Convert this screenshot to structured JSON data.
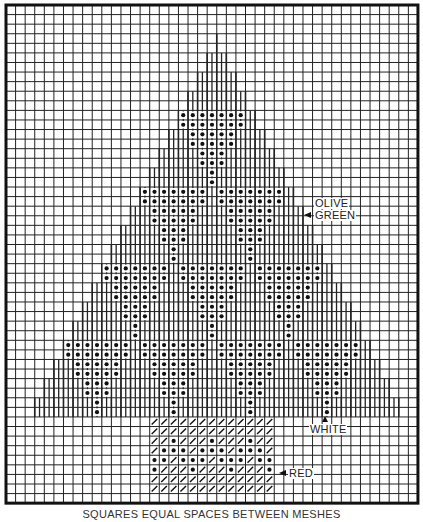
{
  "grid": {
    "origin_x": 6,
    "origin_y": 5,
    "cell": 9.58,
    "cols": 43,
    "rows": 52,
    "line_color": "#222222",
    "border_width": 3
  },
  "tree": {
    "apex_col": 22,
    "apex_row": 3,
    "lines_bottom_row": 43,
    "rows_per_step": 2,
    "half_width_start": 0,
    "max_half_width": 21
  },
  "dot_tiers": [
    {
      "row": 11,
      "starts": [
        18
      ]
    },
    {
      "row": 19,
      "starts": [
        14,
        22
      ]
    },
    {
      "row": 27,
      "starts": [
        10,
        18,
        26
      ]
    },
    {
      "row": 35,
      "starts": [
        6,
        14,
        22,
        30
      ]
    }
  ],
  "triangle_widths": [
    7,
    7,
    5,
    5,
    3,
    3,
    1,
    1
  ],
  "trunk": {
    "col": 15,
    "row": 43,
    "cols": 13,
    "rows": 8,
    "dot_rows": {
      "2": [
        2,
        6,
        10
      ],
      "3": [
        1,
        2,
        3,
        5,
        6,
        7,
        9,
        10,
        11
      ],
      "4": [
        0,
        1,
        3,
        4,
        5,
        7,
        8,
        9,
        11,
        12
      ],
      "5": [
        0,
        4,
        8,
        12
      ]
    }
  },
  "labels": {
    "olive": "OLIVE",
    "green": "GREEN",
    "white": "WHITE",
    "red": "RED"
  },
  "caption": "SQUARES EQUAL SPACES BETWEEN MESHES"
}
